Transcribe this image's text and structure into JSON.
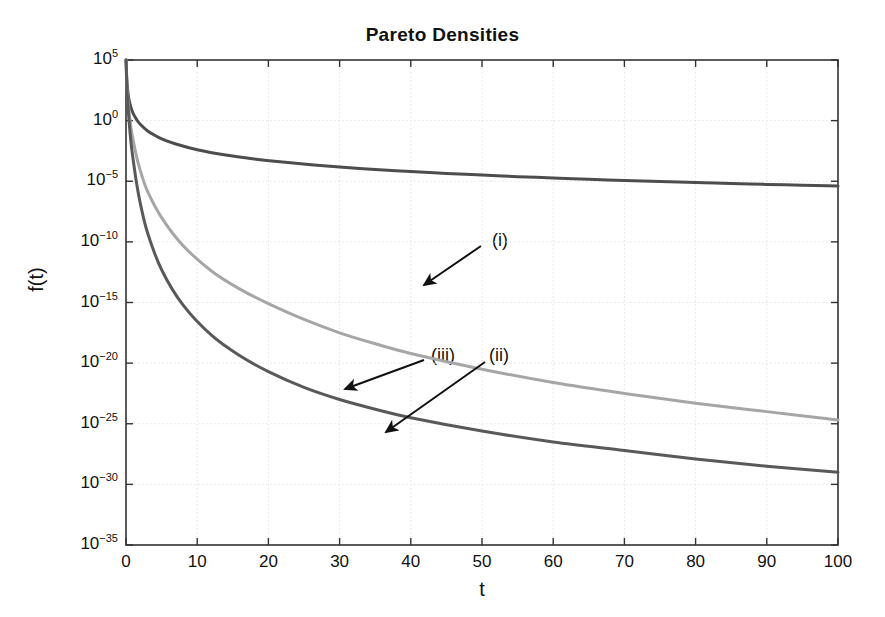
{
  "chart_data": {
    "type": "line",
    "title": "Pareto Densities",
    "xlabel": "t",
    "ylabel": "f(t)",
    "xlim": [
      0,
      100
    ],
    "ylim": [
      1e-35,
      100000.0
    ],
    "yscale": "log",
    "grid": true,
    "legend": "none",
    "xticks": [
      "0",
      "10",
      "20",
      "30",
      "40",
      "50",
      "60",
      "70",
      "80",
      "90",
      "100"
    ],
    "xtick_values": [
      0,
      10,
      20,
      30,
      40,
      50,
      60,
      70,
      80,
      90,
      100
    ],
    "yticks": [
      "10^5",
      "10^0",
      "10^-5",
      "10^-10",
      "10^-15",
      "10^-20",
      "10^-25",
      "10^-30",
      "10^-35"
    ],
    "ytick_exponents": [
      5,
      0,
      -5,
      -10,
      -15,
      -20,
      -25,
      -30,
      -35
    ],
    "ytick_mantissa": "10",
    "series": [
      {
        "name": "(i)",
        "color": "#4d4d4d",
        "width": 3.0,
        "x": [
          0.05,
          0.1,
          0.2,
          0.4,
          0.7,
          1,
          1.5,
          2,
          3,
          4,
          5,
          7,
          10,
          14,
          18,
          22,
          26,
          30,
          35,
          40,
          45,
          50,
          55,
          60,
          65,
          70,
          75,
          80,
          85,
          90,
          95,
          100
        ],
        "y": [
          32000.0,
          4000.0,
          500.0,
          62.5,
          11.7,
          4.0,
          1.19,
          0.5,
          0.148,
          0.0625,
          0.032,
          0.0117,
          0.004,
          0.00146,
          0.000686,
          0.000376,
          0.000228,
          0.000148,
          9.33e-05,
          6.25e-05,
          4.39e-05,
          3.2e-05,
          2.4e-05,
          1.85e-05,
          1.46e-05,
          1.17e-05,
          9.48e-06,
          7.81e-06,
          6.51e-06,
          5.49e-06,
          4.67e-06,
          4e-06
        ],
        "y_visual_exponents": [
          4.5,
          3.6,
          2.7,
          1.8,
          1.07,
          0.6,
          0.08,
          -0.3,
          -0.83,
          -1.2,
          -1.5,
          -1.93,
          -2.4,
          -2.84,
          -3.16,
          -3.42,
          -3.64,
          -3.83,
          -4.03,
          -4.2,
          -4.36,
          -4.49,
          -4.62,
          -4.73,
          -4.84,
          -4.93,
          -5.02,
          -5.11,
          -5.19,
          -5.26,
          -5.33,
          -5.4
        ]
      },
      {
        "name": "(iii)",
        "color": "#a6a6a6",
        "width": 3.0,
        "x": [
          0.05,
          0.1,
          0.2,
          0.4,
          0.7,
          1,
          1.5,
          2,
          3,
          5,
          8,
          12,
          16,
          20,
          25,
          30,
          35,
          40,
          50,
          60,
          70,
          80,
          90,
          100
        ],
        "y": [
          10000.0,
          1000.0,
          100.0,
          10,
          2.1,
          1.0,
          0.35,
          0.15,
          0.05,
          0.012,
          0.003,
          0.0008,
          0.0003,
          0.00013,
          5e-05,
          2.3e-05,
          1.2e-05,
          7e-06,
          2.8e-06,
          1.3e-06,
          7e-07,
          4e-07,
          2.5e-07,
          1.6e-07
        ],
        "y_visual_exponents": [
          4.2,
          3.2,
          2.2,
          0.9,
          -0.6,
          -1.6,
          -3.0,
          -4.1,
          -5.8,
          -8.0,
          -10.3,
          -12.4,
          -13.9,
          -15.1,
          -16.4,
          -17.5,
          -18.4,
          -19.2,
          -20.5,
          -21.6,
          -22.5,
          -23.3,
          -24.0,
          -24.7
        ]
      },
      {
        "name": "(ii)",
        "color": "#595959",
        "width": 3.0,
        "x": [
          0.05,
          0.1,
          0.2,
          0.4,
          0.7,
          1,
          1.5,
          2,
          3,
          5,
          8,
          12,
          16,
          20,
          25,
          30,
          35,
          40,
          50,
          60,
          70,
          80,
          90,
          100
        ],
        "y": [
          10000.0,
          1000.0,
          100.0,
          10,
          2.1,
          1.0,
          0.35,
          0.15,
          0.05,
          0.012,
          0.003,
          0.0008,
          0.0003,
          0.00013,
          5e-05,
          2.3e-05,
          1.2e-05,
          7e-06,
          2.8e-06,
          1.3e-06,
          7e-07,
          4e-07,
          2.5e-07,
          1.6e-07
        ],
        "y_visual_exponents": [
          4.2,
          3.1,
          1.9,
          0.2,
          -1.8,
          -3.2,
          -5.2,
          -6.8,
          -9.2,
          -12.3,
          -15.2,
          -17.7,
          -19.4,
          -20.7,
          -22.0,
          -23.0,
          -23.8,
          -24.5,
          -25.6,
          -26.5,
          -27.2,
          -27.9,
          -28.5,
          -29.0
        ]
      }
    ],
    "annotations": [
      {
        "label": "(i)",
        "label_x": 492,
        "label_y": 230,
        "arrow_from_x": 481,
        "arrow_from_y": 246,
        "arrow_to_x": 424,
        "arrow_to_y": 285
      },
      {
        "label": "(iii)",
        "label_x": 431,
        "label_y": 345,
        "arrow_from_x": 424,
        "arrow_from_y": 360,
        "arrow_to_x": 345,
        "arrow_to_y": 389
      },
      {
        "label": "(ii)",
        "label_x": 489,
        "label_y": 345,
        "arrow_from_x": 485,
        "arrow_from_y": 362,
        "arrow_to_x": 386,
        "arrow_to_y": 432
      }
    ],
    "style": {
      "axis_color": "#333333",
      "grid_color": "#e2e2e2",
      "background": "#ffffff",
      "plot_left": 126,
      "plot_top": 60,
      "plot_right": 838,
      "plot_bottom": 545
    }
  }
}
